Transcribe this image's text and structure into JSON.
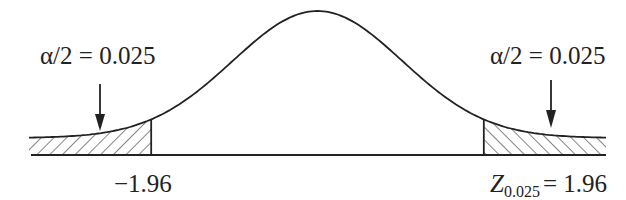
{
  "figure": {
    "type": "normal-distribution-two-tailed",
    "left_tail_label": "α/2 = 0.025",
    "right_tail_label": "α/2 = 0.025",
    "left_critical_value": "−1.96",
    "right_critical_symbol": "Z",
    "right_critical_subscript": "0.025",
    "right_critical_value": "= 1.96",
    "line_color": "#222222"
  },
  "chart_data": {
    "type": "area",
    "title": "",
    "distribution": "standard normal",
    "shaded_regions": [
      {
        "from": "-inf",
        "to": -1.96,
        "area": 0.025,
        "label": "α/2=0.025",
        "hatch": "forward"
      },
      {
        "from": 1.96,
        "to": "inf",
        "area": 0.025,
        "label": "α/2=0.025",
        "hatch": "backward"
      }
    ],
    "critical_values": [
      -1.96,
      1.96
    ],
    "tick_labels": [
      "−1.96",
      "Z0.025 = 1.96"
    ],
    "x_range": [
      -3.4,
      3.4
    ]
  }
}
